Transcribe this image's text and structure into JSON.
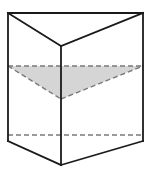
{
  "figure": {
    "shape_type": "triangular-prism",
    "caption": "",
    "canvas": {
      "width": 153,
      "height": 174,
      "background": "#ffffff"
    },
    "colors": {
      "outline": "#1a1a1a",
      "hidden_edge": "#7a7a7a",
      "shaded_face": "#d5d5d5",
      "background": "#ffffff"
    },
    "stroke_widths": {
      "solid_edge": 1.8,
      "hidden_edge": 1.4
    },
    "dash_pattern": "5,3",
    "vertices": {
      "top_back_left": {
        "x": 8,
        "y": 13
      },
      "top_back_right": {
        "x": 143,
        "y": 13
      },
      "top_front": {
        "x": 61,
        "y": 46
      },
      "mid_left": {
        "x": 8,
        "y": 66
      },
      "mid_right": {
        "x": 143,
        "y": 66
      },
      "mid_front": {
        "x": 61,
        "y": 99
      },
      "low_left": {
        "x": 8,
        "y": 135
      },
      "low_right": {
        "x": 143,
        "y": 135
      },
      "bottom_back_left": {
        "x": 8,
        "y": 141
      },
      "bottom_back_right": {
        "x": 143,
        "y": 141
      },
      "bottom_front": {
        "x": 61,
        "y": 165
      }
    },
    "edges": [
      {
        "name": "top-back-edge",
        "style": "solid",
        "from": "top_back_left",
        "to": "top_back_right"
      },
      {
        "name": "top-left-slant",
        "style": "solid",
        "from": "top_back_left",
        "to": "top_front"
      },
      {
        "name": "top-right-slant",
        "style": "solid",
        "from": "top_front",
        "to": "top_back_right"
      },
      {
        "name": "left-vertical-edge",
        "style": "solid",
        "from": "top_back_left",
        "to": "bottom_back_left"
      },
      {
        "name": "right-vertical-edge",
        "style": "solid",
        "from": "top_back_right",
        "to": "bottom_back_right"
      },
      {
        "name": "front-vertical-edge",
        "style": "solid",
        "from": "top_front",
        "to": "bottom_front"
      },
      {
        "name": "cross-section-back-edge",
        "style": "dashed",
        "from": "mid_left",
        "to": "mid_right"
      },
      {
        "name": "cross-section-left-slant",
        "style": "dashed",
        "from": "mid_left",
        "to": "mid_front"
      },
      {
        "name": "cross-section-right-slant",
        "style": "dashed",
        "from": "mid_front",
        "to": "mid_right"
      },
      {
        "name": "lower-hidden-back-edge",
        "style": "dashed",
        "from": "low_left",
        "to": "low_right"
      },
      {
        "name": "bottom-left-slant",
        "style": "solid",
        "from": "bottom_back_left",
        "to": "bottom_front"
      },
      {
        "name": "bottom-right-slant",
        "style": "solid",
        "from": "bottom_front",
        "to": "bottom_back_right"
      }
    ],
    "shaded_face": {
      "name": "cross-section-triangle",
      "points": "8,66 143,66 61,99",
      "fill": "#d5d5d5"
    },
    "labels": []
  }
}
